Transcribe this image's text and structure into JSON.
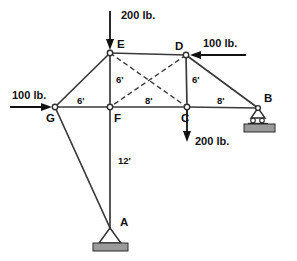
{
  "figure": {
    "type": "statics-truss-diagram",
    "width": 297,
    "height": 261,
    "background_color": "#ffffff",
    "member_color": "#3a3a3a",
    "label_color": "#111111"
  },
  "joints": [
    {
      "id": "A",
      "label": "A",
      "x": 110,
      "y": 228,
      "label_x": 120,
      "label_y": 226,
      "support": "pin"
    },
    {
      "id": "B",
      "label": "B",
      "x": 258,
      "y": 108,
      "label_x": 264,
      "label_y": 102,
      "support": "roller"
    },
    {
      "id": "C",
      "label": "C",
      "x": 187,
      "y": 107,
      "label_x": 181,
      "label_y": 122,
      "support": "none"
    },
    {
      "id": "D",
      "label": "D",
      "x": 186,
      "y": 55,
      "label_x": 177,
      "label_y": 50,
      "support": "none"
    },
    {
      "id": "E",
      "label": "E",
      "x": 110,
      "y": 53,
      "label_x": 117,
      "label_y": 48,
      "support": "none"
    },
    {
      "id": "F",
      "label": "F",
      "x": 110,
      "y": 107,
      "label_x": 114,
      "label_y": 122,
      "support": "none"
    },
    {
      "id": "G",
      "label": "G",
      "x": 55,
      "y": 107,
      "label_x": 47,
      "label_y": 122,
      "support": "none"
    }
  ],
  "members": [
    {
      "from": "E",
      "to": "D",
      "style": "solid",
      "name": "member-ED"
    },
    {
      "from": "G",
      "to": "E",
      "style": "solid",
      "name": "member-GE"
    },
    {
      "from": "E",
      "to": "F",
      "style": "solid",
      "name": "member-EF"
    },
    {
      "from": "D",
      "to": "C",
      "style": "solid",
      "name": "member-DC"
    },
    {
      "from": "D",
      "to": "B",
      "style": "solid",
      "name": "member-DB"
    },
    {
      "from": "G",
      "to": "F",
      "style": "solid",
      "name": "member-GF"
    },
    {
      "from": "F",
      "to": "C",
      "style": "solid",
      "name": "member-FC"
    },
    {
      "from": "C",
      "to": "B",
      "style": "solid",
      "name": "member-CB"
    },
    {
      "from": "F",
      "to": "A",
      "style": "solid",
      "name": "member-FA"
    },
    {
      "from": "G",
      "to": "A",
      "style": "solid",
      "name": "member-GA"
    },
    {
      "from": "E",
      "to": "C",
      "style": "dashed",
      "name": "member-EC-brace"
    },
    {
      "from": "D",
      "to": "F",
      "style": "dashed",
      "name": "member-DF-brace"
    }
  ],
  "dimensions": [
    {
      "id": "EF",
      "label": "6'",
      "x": 119,
      "y": 82,
      "name": "dimension-EF-6ft"
    },
    {
      "id": "DC",
      "label": "6'",
      "x": 194,
      "y": 82,
      "name": "dimension-DC-6ft"
    },
    {
      "id": "GF",
      "label": "6'",
      "x": 80,
      "y": 103,
      "name": "dimension-GF-6ft"
    },
    {
      "id": "FC",
      "label": "8'",
      "x": 147,
      "y": 103,
      "name": "dimension-FC-8ft"
    },
    {
      "id": "CB",
      "label": "8'",
      "x": 219,
      "y": 103,
      "name": "dimension-CB-8ft"
    },
    {
      "id": "FA",
      "label": "12'",
      "x": 120,
      "y": 163,
      "name": "dimension-FA-12ft"
    }
  ],
  "loads": [
    {
      "id": "load-E",
      "label": "200 lb.",
      "magnitude": 200,
      "unit": "lb.",
      "direction": "down",
      "applied_at": "E",
      "arrow": {
        "x1": 110,
        "y1": 11,
        "x2": 110,
        "y2": 50
      },
      "label_x": 121,
      "label_y": 19
    },
    {
      "id": "load-G",
      "label": "100 lb.",
      "magnitude": 100,
      "unit": "lb.",
      "direction": "right",
      "applied_at": "G",
      "arrow": {
        "x1": 10,
        "y1": 107,
        "x2": 52,
        "y2": 107
      },
      "label_x": 12,
      "label_y": 99
    },
    {
      "id": "load-D",
      "label": "100 lb.",
      "magnitude": 100,
      "unit": "lb.",
      "direction": "left",
      "applied_at": "D",
      "arrow": {
        "x1": 246,
        "y1": 55,
        "x2": 190,
        "y2": 55
      },
      "label_x": 203,
      "label_y": 47
    },
    {
      "id": "load-C",
      "label": "200 lb.",
      "magnitude": 200,
      "unit": "lb.",
      "direction": "down",
      "applied_at": "C",
      "arrow": {
        "x1": 187,
        "y1": 110,
        "x2": 187,
        "y2": 142
      },
      "label_x": 195,
      "label_y": 145
    }
  ],
  "supports": {
    "A": {
      "type": "pin",
      "label": "A",
      "x": 110,
      "y": 228
    },
    "B": {
      "type": "roller",
      "label": "B",
      "x": 258,
      "y": 108
    }
  }
}
